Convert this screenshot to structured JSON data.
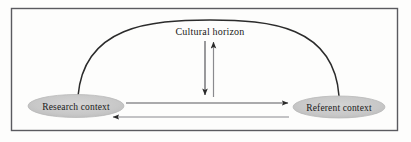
{
  "figure": {
    "type": "diagram",
    "title_label": "Cultural horizon",
    "background_color": "#fdfdfc",
    "border_color": "#55555a",
    "line_color": "#2b2b2b",
    "node_fill_color": "#c9c9c9",
    "node_stroke_color": "#b4b4b4",
    "nodes": [
      {
        "id": "research-context",
        "label": "Research context",
        "shape": "ellipse",
        "cx": 76,
        "cy": 106,
        "rx": 48,
        "ry": 11.5
      },
      {
        "id": "referent-context",
        "label": "Referent context",
        "shape": "ellipse",
        "cx": 339,
        "cy": 107,
        "rx": 46,
        "ry": 11
      }
    ],
    "arc": {
      "id": "cultural-horizon-arc",
      "from": "research-context",
      "to": "referent-context",
      "apex_y": 20,
      "arrowheads": "none"
    },
    "connectors": [
      {
        "id": "research-to-referent-arrow",
        "direction": "right",
        "from": "research-context",
        "to": "referent-context",
        "x1": 126,
        "x2": 290,
        "y": 103
      },
      {
        "id": "referent-to-research-arrow",
        "direction": "left",
        "from": "referent-context",
        "to": "research-context",
        "x1": 288,
        "x2": 111,
        "y": 117
      },
      {
        "id": "horizon-down-arrow",
        "direction": "down",
        "x": 205,
        "y1": 41,
        "y2": 97
      },
      {
        "id": "horizon-up-arrow",
        "direction": "up",
        "x": 213,
        "y1": 97,
        "y2": 40
      }
    ]
  }
}
